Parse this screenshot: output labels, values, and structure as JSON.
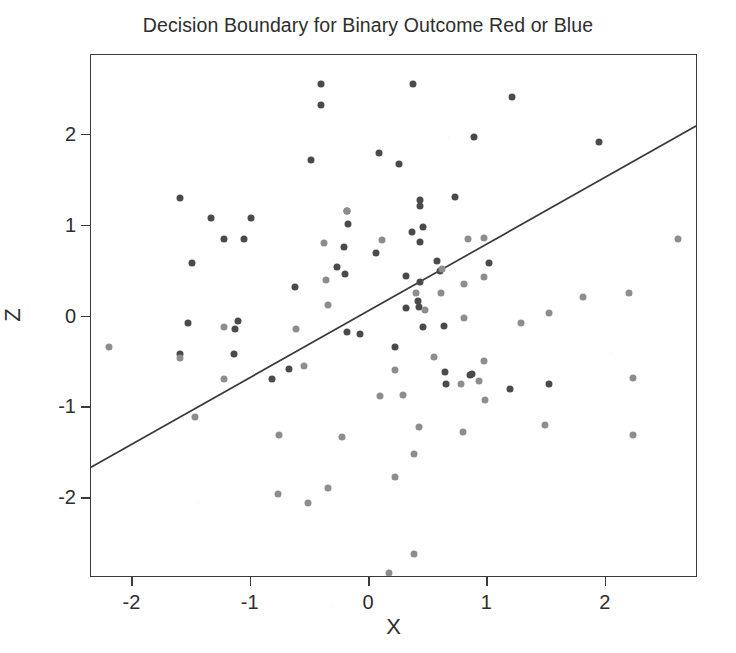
{
  "chart_data": {
    "type": "scatter",
    "title": "Decision Boundary for Binary Outcome Red or Blue",
    "xlabel": "X",
    "ylabel": "Z",
    "xlim": [
      -2.35,
      2.78
    ],
    "ylim": [
      -2.88,
      2.88
    ],
    "xticks": [
      -2,
      -1,
      0,
      1,
      2
    ],
    "xticklabels": [
      "-2",
      "-1",
      "0",
      "1",
      "2"
    ],
    "yticks": [
      2,
      1,
      0,
      -1,
      -2
    ],
    "yticklabels": [
      "2",
      "1",
      "0",
      "-1",
      "-2"
    ],
    "grid": false,
    "legend": "none",
    "point_radius_px": 3.5,
    "colors": {
      "class_above": "#4a4a4a",
      "class_below": "#8d8d8d",
      "boundary_line": "#3a3a3a",
      "axis": "#3a3a3a",
      "background": "#ffffff",
      "text": "#2e2e2e"
    },
    "boundary_line": {
      "label": "decision boundary",
      "x_start": -2.35,
      "y_start": -1.66,
      "x_end": 2.78,
      "y_end": 2.11,
      "slope": 0.735,
      "intercept": -0.38
    },
    "series": [
      {
        "name": "Red",
        "color": "#4a4a4a",
        "points": [
          [
            -0.41,
            2.56
          ],
          [
            -0.41,
            2.33
          ],
          [
            -0.49,
            1.72
          ],
          [
            0.08,
            1.8
          ],
          [
            -1.6,
            1.3
          ],
          [
            -1.34,
            1.09
          ],
          [
            -1.0,
            1.09
          ],
          [
            -0.19,
            1.16
          ],
          [
            -0.18,
            1.02
          ],
          [
            -1.23,
            0.85
          ],
          [
            -1.06,
            0.85
          ],
          [
            0.37,
            2.56
          ],
          [
            1.21,
            2.42
          ],
          [
            0.89,
            1.98
          ],
          [
            1.94,
            1.92
          ],
          [
            0.25,
            1.68
          ],
          [
            0.73,
            1.32
          ],
          [
            0.43,
            1.22
          ],
          [
            0.36,
            0.93
          ],
          [
            0.46,
            0.99
          ],
          [
            0.43,
            0.82
          ],
          [
            0.57,
            0.61
          ],
          [
            0.6,
            0.5
          ],
          [
            1.01,
            0.59
          ],
          [
            0.31,
            0.45
          ],
          [
            0.43,
            0.38
          ],
          [
            0.31,
            0.09
          ],
          [
            0.41,
            0.17
          ],
          [
            0.42,
            0.1
          ],
          [
            -1.14,
            -0.41
          ],
          [
            -0.82,
            -0.69
          ],
          [
            -1.6,
            -0.41
          ],
          [
            -1.53,
            -0.07
          ],
          [
            -0.68,
            -0.58
          ],
          [
            -1.11,
            -0.05
          ],
          [
            -1.5,
            0.59
          ],
          [
            -1.13,
            -0.14
          ],
          [
            -0.63,
            0.32
          ],
          [
            -0.19,
            -0.17
          ],
          [
            -0.08,
            -0.19
          ],
          [
            0.43,
            1.28
          ],
          [
            0.64,
            -0.61
          ],
          [
            0.87,
            -0.63
          ],
          [
            1.52,
            -0.74
          ],
          [
            0.85,
            -0.64
          ],
          [
            0.65,
            -0.74
          ],
          [
            1.19,
            -0.8
          ],
          [
            0.46,
            -0.12
          ],
          [
            0.22,
            -0.34
          ],
          [
            0.63,
            -0.11
          ],
          [
            -0.27,
            0.54
          ],
          [
            -0.21,
            0.76
          ],
          [
            0.06,
            0.7
          ],
          [
            -0.2,
            0.47
          ]
        ]
      },
      {
        "name": "Blue",
        "color": "#8d8d8d",
        "points": [
          [
            -0.19,
            1.16
          ],
          [
            -0.38,
            0.81
          ],
          [
            0.11,
            0.84
          ],
          [
            0.84,
            0.85
          ],
          [
            0.62,
            0.52
          ],
          [
            -0.36,
            0.4
          ],
          [
            0.97,
            0.44
          ],
          [
            0.97,
            0.86
          ],
          [
            0.61,
            0.26
          ],
          [
            0.8,
            0.36
          ],
          [
            2.61,
            0.85
          ],
          [
            2.2,
            0.26
          ],
          [
            0.4,
            0.26
          ],
          [
            0.47,
            0.07
          ],
          [
            0.8,
            -0.02
          ],
          [
            1.28,
            -0.07
          ],
          [
            1.52,
            0.04
          ],
          [
            0.97,
            -0.49
          ],
          [
            0.22,
            -0.59
          ],
          [
            1.81,
            0.22
          ],
          [
            2.23,
            -0.68
          ],
          [
            -0.55,
            -0.54
          ],
          [
            -0.62,
            -0.14
          ],
          [
            -1.23,
            -0.12
          ],
          [
            -1.6,
            -0.46
          ],
          [
            -0.35,
            0.13
          ],
          [
            -0.23,
            -1.33
          ],
          [
            -0.76,
            -1.31
          ],
          [
            -1.23,
            -0.69
          ],
          [
            -0.35,
            -1.89
          ],
          [
            0.38,
            -1.51
          ],
          [
            0.09,
            -0.88
          ],
          [
            0.93,
            -0.71
          ],
          [
            -0.52,
            -2.05
          ],
          [
            0.38,
            -2.62
          ],
          [
            0.22,
            -1.77
          ],
          [
            -0.77,
            -1.95
          ],
          [
            0.79,
            -1.27
          ],
          [
            -1.47,
            -1.11
          ],
          [
            -2.2,
            -0.34
          ],
          [
            0.42,
            -1.22
          ],
          [
            0.78,
            -0.74
          ],
          [
            1.49,
            -1.19
          ],
          [
            2.23,
            -1.3
          ],
          [
            0.55,
            -0.45
          ],
          [
            0.29,
            -0.87
          ],
          [
            0.98,
            -0.92
          ],
          [
            0.17,
            -2.83
          ]
        ]
      }
    ]
  }
}
